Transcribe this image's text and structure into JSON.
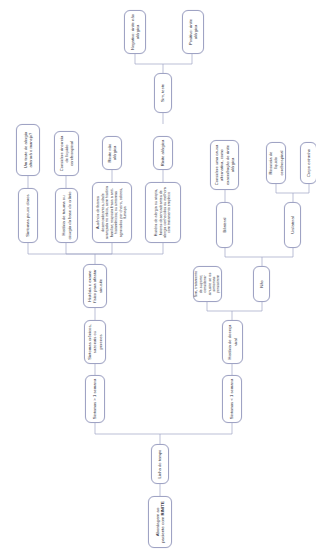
{
  "diagram": {
    "title": "Abordagem ao paciente com RINITE",
    "type": "decision-flowchart",
    "orientation": "rotated-90-text-vertical",
    "language": "pt-BR",
    "colors": {
      "node_border": "#9fa3c4",
      "node_fill": "#ffffff",
      "link": "#9fa3c4",
      "text": "#2b2b38",
      "page_background": "#ffffff"
    },
    "nodes": {
      "root": "Abordagem ao paciente com RINITE",
      "timeline": "Linha do tempo",
      "sintomas_maior": "Sintomas > 1 semana",
      "sintomas_menor": "Sintomas < 1 semana",
      "cronicos": "Sintomas crônicos, sazonais ou perenes",
      "historia_doenca_viral": "História de doença viral",
      "historia_exame": "História e exame físico para afastar sinusite",
      "sim_tratamento": "Sim, tratamento de suporte; considerar sinusite se os sintomas persistirem",
      "nao": "Não",
      "historia_alergia": "História de alergia ou atopia, fatores desencadeantes de alergia conhecidos ou melhora com tratamento empírico",
      "ausencia_fatores": "Ausência de fatores desencadeantes, idade avançada no início, sem história familiar; resposta fraca a anti-histamínicos; ou sintomas agravados por cheiro, odores, fumaça",
      "historia_trauma": "História de trauma ou cirurgia da base do crânio",
      "bilateral": "Bilateral",
      "unilateral": "Unilateral",
      "rinite_alergica": "Rinite alérgica",
      "rinite_nao_alergica": "Rinite não alérgica",
      "sintomas_pouco_claros": "Sintomas pouco claros",
      "considere_rinorreia": "Considere rinorreia de líquido cerebrospinal",
      "considere_causa": "Considere uma causa alternativa, como exacerbação de rinite alérgica",
      "rinorreia_lcr": "Rinorreia de líquido cerebrospinal",
      "corpo_estranho": "Corpo estranho",
      "teste_alergia": "Um teste de alergia alterará o manejo?",
      "sim_teste": "Sim, teste",
      "negativo": "Negativo: rinite não alérgica",
      "positivo": "Positivo: rinite alérgica"
    },
    "edges": [
      {
        "from": "root",
        "to": "timeline"
      },
      {
        "from": "timeline",
        "to": "sintomas_maior"
      },
      {
        "from": "timeline",
        "to": "sintomas_menor"
      },
      {
        "from": "sintomas_maior",
        "to": "cronicos"
      },
      {
        "from": "sintomas_menor",
        "to": "historia_doenca_viral"
      },
      {
        "from": "cronicos",
        "to": "historia_exame"
      },
      {
        "from": "historia_doenca_viral",
        "to": "sim_tratamento"
      },
      {
        "from": "historia_doenca_viral",
        "to": "nao"
      },
      {
        "from": "historia_exame",
        "to": "historia_alergia"
      },
      {
        "from": "historia_exame",
        "to": "ausencia_fatores"
      },
      {
        "from": "historia_exame",
        "to": "historia_trauma"
      },
      {
        "from": "historia_exame",
        "to": "sintomas_pouco_claros"
      },
      {
        "from": "nao",
        "to": "bilateral"
      },
      {
        "from": "nao",
        "to": "unilateral"
      },
      {
        "from": "historia_alergia",
        "to": "rinite_alergica"
      },
      {
        "from": "ausencia_fatores",
        "to": "rinite_nao_alergica"
      },
      {
        "from": "historia_trauma",
        "to": "considere_rinorreia"
      },
      {
        "from": "sintomas_pouco_claros",
        "to": "teste_alergia"
      },
      {
        "from": "bilateral",
        "to": "considere_causa"
      },
      {
        "from": "unilateral",
        "to": "rinorreia_lcr"
      },
      {
        "from": "unilateral",
        "to": "corpo_estranho"
      },
      {
        "from": "teste_alergia",
        "to": "sim_teste"
      },
      {
        "from": "sim_teste",
        "to": "negativo"
      },
      {
        "from": "sim_teste",
        "to": "positivo"
      }
    ]
  }
}
